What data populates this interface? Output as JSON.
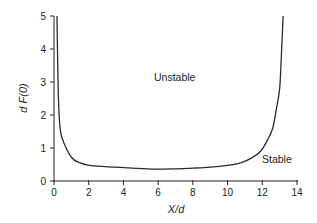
{
  "chart_data": {
    "type": "line",
    "title": "",
    "xlabel": "X/d",
    "ylabel": "d F(0)",
    "xlim": [
      0,
      14
    ],
    "ylim": [
      0,
      5
    ],
    "xticks": [
      0,
      2,
      4,
      6,
      8,
      10,
      12,
      14
    ],
    "yticks": [
      0,
      1,
      2,
      3,
      4,
      5
    ],
    "grid": false,
    "legend": null,
    "series": [
      {
        "name": "stability boundary",
        "x": [
          0.17,
          0.25,
          0.35,
          0.5,
          0.7,
          0.9,
          1.15,
          1.5,
          1.96,
          2.5,
          3.5,
          4.5,
          5.8,
          7.0,
          8.0,
          9.0,
          10.1,
          10.8,
          11.4,
          11.9,
          12.3,
          12.6,
          12.8,
          13.0,
          13.1,
          13.2
        ],
        "y": [
          5.0,
          2.6,
          1.6,
          1.25,
          1.0,
          0.8,
          0.64,
          0.55,
          0.48,
          0.45,
          0.42,
          0.39,
          0.36,
          0.37,
          0.39,
          0.42,
          0.48,
          0.56,
          0.7,
          0.9,
          1.24,
          1.6,
          2.15,
          2.8,
          3.8,
          5.0
        ]
      }
    ],
    "annotations": [
      {
        "text": "Unstable",
        "x": 5.8,
        "y": 3.1
      },
      {
        "text": "Stable",
        "x": 12.0,
        "y": 0.55
      }
    ]
  },
  "labels": {
    "xlabel": "X/d",
    "ylabel": "d F(0)",
    "unstable": "Unstable",
    "stable": "Stable"
  }
}
